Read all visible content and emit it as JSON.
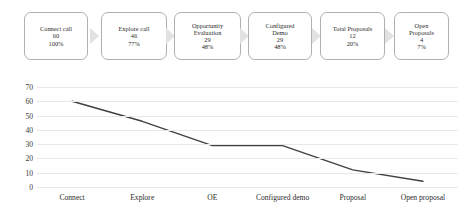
{
  "funnel": {
    "stages": [
      {
        "label": "Connect call",
        "count": "60",
        "percent": "100%"
      },
      {
        "label": "Explore call",
        "count": "46",
        "percent": "77%"
      },
      {
        "label": "Opportunity\nEvaluation",
        "count": "29",
        "percent": "48%"
      },
      {
        "label": "Configured\nDemo",
        "count": "29",
        "percent": "48%"
      },
      {
        "label": "Total Proposals",
        "count": "12",
        "percent": "20%"
      },
      {
        "label": "Open\nProposals",
        "count": "4",
        "percent": "7%"
      }
    ],
    "arrow_color": "#e2e2e2",
    "box_border_color": "#b0b0b0"
  },
  "chart_data": {
    "type": "line",
    "title": "",
    "xlabel": "",
    "ylabel": "",
    "categories": [
      "Connect",
      "Explore",
      "OE",
      "Configured demo",
      "Proposal",
      "Open proposal"
    ],
    "values": [
      60,
      46,
      29,
      29,
      12,
      4
    ],
    "ylim": [
      0,
      70
    ],
    "yticks": [
      "0",
      "10",
      "20",
      "30",
      "40",
      "50",
      "60",
      "70"
    ],
    "grid": true,
    "legend": "none",
    "line_color": "#404040"
  }
}
